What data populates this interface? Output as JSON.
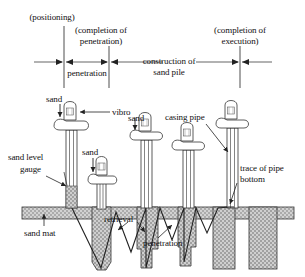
{
  "figure": {
    "timeline": {
      "stages": [
        {
          "id": "positioning",
          "label": "(positioning)",
          "x": 46,
          "y": 12
        },
        {
          "id": "completion-of-penetration",
          "label_line1": "(completion of",
          "label_line2": "penetration)",
          "x": 83,
          "y": 25
        },
        {
          "id": "completion-of-execution",
          "label_line1": "(completion of",
          "label_line2": "execution)",
          "x": 200,
          "y": 25
        }
      ],
      "spans": [
        {
          "id": "penetration",
          "label": "penetration",
          "x": 62,
          "y": 70
        },
        {
          "id": "construction-of-sand-pile",
          "label_line1": "construction of",
          "label_line2": "sand pile",
          "x": 131,
          "y": 58
        }
      ]
    },
    "annotations": [
      {
        "id": "sand-left",
        "label": "sand",
        "x": 47,
        "y": 97
      },
      {
        "id": "vibro",
        "label": "vibro",
        "x": 112,
        "y": 110
      },
      {
        "id": "sand-middle",
        "label": "sand",
        "x": 100,
        "y": 148
      },
      {
        "id": "sand-right",
        "label": "sand",
        "x": 155,
        "y": 112
      },
      {
        "id": "casing-pipe",
        "label": "casing pipe",
        "x": 195,
        "y": 113
      },
      {
        "id": "sand-level-gauge",
        "label_line1": "sand level",
        "label_line2": "gauge",
        "x": 8,
        "y": 155
      },
      {
        "id": "trace-of-pipe-bottom",
        "label_line1": "trace of pipe",
        "label_line2": "bottom",
        "x": 232,
        "y": 162
      },
      {
        "id": "sand-mat",
        "label": "sand mat",
        "x": 30,
        "y": 228
      },
      {
        "id": "retrieval",
        "label": "retrieval",
        "x": 108,
        "y": 215
      },
      {
        "id": "penetration-lower",
        "label": "penetration",
        "x": 145,
        "y": 240
      }
    ],
    "colors": {
      "line": "#222222",
      "text": "#111111",
      "hatch_fill": "#c9c9c9",
      "background": "#ffffff"
    }
  }
}
